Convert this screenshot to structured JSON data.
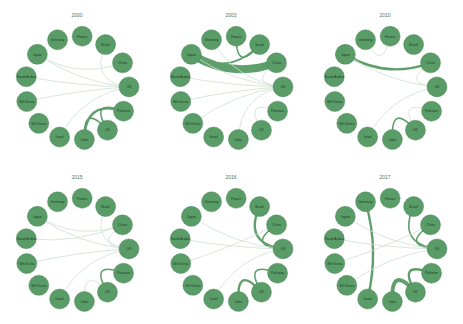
{
  "nodes": [
    "Germany",
    "France",
    "Brazil",
    "China",
    "US",
    "Pakistan",
    "UK",
    "India",
    "Israel",
    "South Korea",
    "North Korea",
    "Saudi Arabia",
    "Japan"
  ],
  "node_labels_short": [
    "Germany",
    "France",
    "Brazil",
    "China",
    "US",
    "Pakistan",
    "UK",
    "India",
    "Israel",
    "Sth Korea",
    "Nth Korea",
    "Saudi Arabia",
    "Japan"
  ],
  "colors": {
    "node": "#5a9c68",
    "node_stroke": "#3f7a4c",
    "edge": "#5f9f6c",
    "edge_light": "#cfe0d2",
    "title": "#4a7a56"
  },
  "panels": [
    {
      "year": "2000",
      "x": 0,
      "y": 0,
      "edges": [
        [
          12,
          4,
          1
        ],
        [
          10,
          4,
          1
        ],
        [
          11,
          4,
          1
        ],
        [
          8,
          4,
          1
        ],
        [
          7,
          5,
          3
        ],
        [
          6,
          5,
          2
        ],
        [
          12,
          3,
          1
        ],
        [
          7,
          6,
          2
        ],
        [
          2,
          4,
          1
        ]
      ]
    },
    {
      "year": "2003",
      "x": 154,
      "y": 0,
      "edges": [
        [
          12,
          3,
          10
        ],
        [
          12,
          2,
          2
        ],
        [
          1,
          2,
          2
        ],
        [
          10,
          4,
          1
        ],
        [
          11,
          4,
          1
        ],
        [
          9,
          4,
          1
        ],
        [
          7,
          4,
          1
        ],
        [
          6,
          5,
          1
        ],
        [
          0,
          4,
          1
        ],
        [
          12,
          4,
          1
        ],
        [
          3,
          4,
          1
        ]
      ]
    },
    {
      "year": "2010",
      "x": 308,
      "y": 0,
      "edges": [
        [
          12,
          3,
          3
        ],
        [
          0,
          1,
          1
        ],
        [
          12,
          4,
          1
        ],
        [
          8,
          4,
          1
        ],
        [
          7,
          6,
          2
        ],
        [
          6,
          5,
          1
        ],
        [
          3,
          4,
          1
        ]
      ]
    },
    {
      "year": "2015",
      "x": 0,
      "y": 162,
      "edges": [
        [
          12,
          4,
          1
        ],
        [
          11,
          3,
          1
        ],
        [
          10,
          4,
          1
        ],
        [
          6,
          5,
          2
        ],
        [
          7,
          6,
          1
        ],
        [
          2,
          4,
          1
        ],
        [
          3,
          4,
          1
        ],
        [
          8,
          4,
          1
        ],
        [
          12,
          3,
          1
        ]
      ]
    },
    {
      "year": "2016",
      "x": 154,
      "y": 162,
      "edges": [
        [
          2,
          4,
          3
        ],
        [
          3,
          4,
          2
        ],
        [
          7,
          6,
          3
        ],
        [
          6,
          5,
          2
        ],
        [
          11,
          4,
          1
        ],
        [
          10,
          3,
          1
        ],
        [
          12,
          4,
          1
        ],
        [
          8,
          4,
          1
        ]
      ]
    },
    {
      "year": "2017",
      "x": 308,
      "y": 162,
      "edges": [
        [
          0,
          8,
          3
        ],
        [
          7,
          6,
          5
        ],
        [
          6,
          5,
          3
        ],
        [
          2,
          4,
          2
        ],
        [
          3,
          4,
          2
        ],
        [
          12,
          4,
          1
        ],
        [
          11,
          4,
          1
        ],
        [
          10,
          3,
          1
        ],
        [
          9,
          4,
          1
        ]
      ]
    }
  ]
}
